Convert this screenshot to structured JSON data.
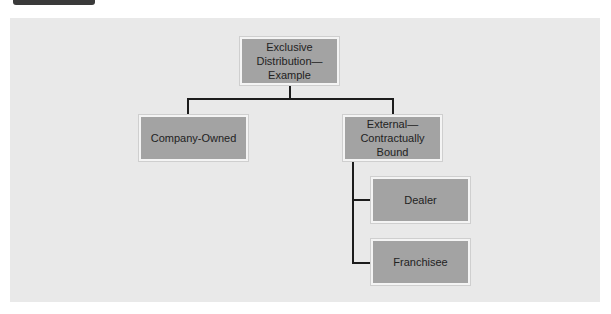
{
  "diagram": {
    "type": "hierarchy",
    "root": {
      "label": "Exclusive\nDistribution—\nExample",
      "label_lines": [
        "Exclusive",
        "Distribution—",
        "Example"
      ]
    },
    "level1": [
      {
        "label": "Company-Owned"
      },
      {
        "label_lines": [
          "External—",
          "Contractually",
          "Bound"
        ]
      }
    ],
    "level2": [
      {
        "parent": "External—Contractually Bound",
        "label": "Dealer"
      },
      {
        "parent": "External—Contractually Bound",
        "label": "Franchisee"
      }
    ]
  },
  "colors": {
    "background_panel": "#e9e9e9",
    "node_fill": "#a3a3a3",
    "node_border": "#f4f4f4",
    "connector": "#1c1c1c",
    "header_tab": "#3a3a3a"
  }
}
